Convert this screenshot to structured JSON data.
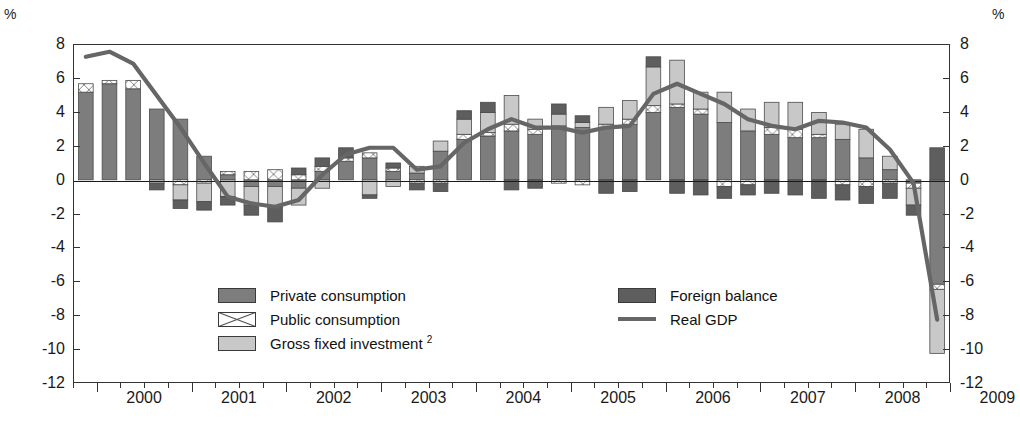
{
  "axis": {
    "unit_left": "%",
    "unit_right": "%",
    "y_ticks": [
      8,
      6,
      4,
      2,
      0,
      -2,
      -4,
      -6,
      -8,
      -10,
      -12
    ],
    "y_tick_labels": [
      "8",
      "6",
      "4",
      "2",
      "0",
      "-2",
      "-4",
      "-6",
      "-8",
      "-10",
      "-12"
    ],
    "x_year_labels": [
      "2000",
      "2001",
      "2002",
      "2003",
      "2004",
      "2005",
      "2006",
      "2007",
      "2008",
      "2009"
    ]
  },
  "legend": {
    "items": [
      {
        "label": "Private consumption",
        "key": "private_consumption",
        "swatch": "solid",
        "color": "#7d7d7d"
      },
      {
        "label": "Public consumption",
        "key": "public_consumption",
        "swatch": "crosshatch",
        "color": "#ffffff"
      },
      {
        "label": "Gross fixed investment",
        "sup": "2",
        "key": "gross_fixed_investment",
        "swatch": "solid",
        "color": "#c8c8c8"
      },
      {
        "label": "Foreign balance",
        "key": "foreign_balance",
        "swatch": "solid",
        "color": "#5e5e5e"
      },
      {
        "label": "Real GDP",
        "key": "real_gdp",
        "swatch": "line",
        "color": "#666666"
      }
    ]
  },
  "chart_data": {
    "type": "bar",
    "subtype": "stacked-bar-with-line",
    "title": "",
    "xlabel": "",
    "ylabel": "%",
    "ylim": [
      -12,
      8
    ],
    "ytick_step": 2,
    "grid": false,
    "legend_position": "inside-bottom",
    "x": [
      "1999Q4",
      "2000Q1",
      "2000Q2",
      "2000Q3",
      "2000Q4",
      "2001Q1",
      "2001Q2",
      "2001Q3",
      "2001Q4",
      "2002Q1",
      "2002Q2",
      "2002Q3",
      "2002Q4",
      "2003Q1",
      "2003Q2",
      "2003Q3",
      "2003Q4",
      "2004Q1",
      "2004Q2",
      "2004Q3",
      "2004Q4",
      "2005Q1",
      "2005Q2",
      "2005Q3",
      "2005Q4",
      "2006Q1",
      "2006Q2",
      "2006Q3",
      "2006Q4",
      "2007Q1",
      "2007Q2",
      "2007Q3",
      "2007Q4",
      "2008Q1",
      "2008Q2",
      "2008Q3",
      "2008Q4"
    ],
    "series": [
      {
        "name": "Private consumption",
        "color": "#7d7d7d",
        "values": [
          5.2,
          5.7,
          5.4,
          4.2,
          3.6,
          1.4,
          0.3,
          -0.4,
          -0.4,
          -0.5,
          0.5,
          1.1,
          1.3,
          0.5,
          0.4,
          1.7,
          2.4,
          2.6,
          2.9,
          2.7,
          3.2,
          3.1,
          3.1,
          3.3,
          4.0,
          4.3,
          3.9,
          3.4,
          2.9,
          2.7,
          2.5,
          2.5,
          2.4,
          1.3,
          0.6,
          -0.2,
          -6.2
        ]
      },
      {
        "name": "Public consumption",
        "color": "#ffffff",
        "values": [
          0.5,
          0.2,
          0.5,
          0.0,
          -0.3,
          -0.2,
          0.2,
          0.5,
          0.6,
          0.3,
          0.3,
          0.2,
          0.3,
          0.2,
          -0.2,
          -0.2,
          0.3,
          0.2,
          0.4,
          0.3,
          -0.2,
          -0.3,
          0.2,
          0.3,
          0.4,
          0.2,
          0.3,
          -0.4,
          -0.3,
          0.4,
          0.5,
          0.2,
          -0.3,
          -0.4,
          -0.2,
          -0.3,
          -0.3
        ]
      },
      {
        "name": "Gross fixed investment",
        "color": "#c8c8c8",
        "values": [
          0.0,
          0.0,
          0.0,
          -0.2,
          -0.9,
          -1.1,
          -1.0,
          -1.1,
          -1.2,
          -1.0,
          -0.5,
          0.0,
          -0.9,
          -0.4,
          0.4,
          0.6,
          0.9,
          1.2,
          1.7,
          0.6,
          0.7,
          0.3,
          1.0,
          1.1,
          2.3,
          2.6,
          1.0,
          1.8,
          1.3,
          1.5,
          1.6,
          1.3,
          0.9,
          1.7,
          0.8,
          -1.0,
          -3.8
        ]
      },
      {
        "name": "Foreign balance",
        "color": "#5e5e5e",
        "values": [
          0.0,
          0.0,
          0.0,
          -0.4,
          -0.5,
          -0.5,
          -0.5,
          -0.6,
          -0.9,
          0.4,
          0.5,
          0.6,
          -0.2,
          0.3,
          -0.4,
          -0.5,
          0.5,
          0.6,
          -0.6,
          -0.5,
          0.6,
          0.4,
          -0.8,
          -0.7,
          0.6,
          -0.8,
          -0.9,
          -0.7,
          -0.6,
          -0.8,
          -0.9,
          -1.1,
          -0.9,
          -1.0,
          -0.9,
          -0.6,
          1.9
        ]
      }
    ],
    "line_series": {
      "name": "Real GDP",
      "color": "#666666",
      "values": [
        7.3,
        7.6,
        6.9,
        5.0,
        3.1,
        1.0,
        -1.0,
        -1.4,
        -1.6,
        -1.2,
        0.3,
        1.5,
        1.9,
        1.9,
        0.6,
        0.8,
        2.2,
        3.0,
        3.6,
        3.1,
        3.1,
        2.8,
        3.1,
        3.2,
        5.1,
        5.7,
        5.1,
        4.5,
        3.6,
        3.2,
        3.0,
        3.5,
        3.4,
        3.1,
        1.8,
        -0.2,
        -8.3
      ]
    }
  }
}
